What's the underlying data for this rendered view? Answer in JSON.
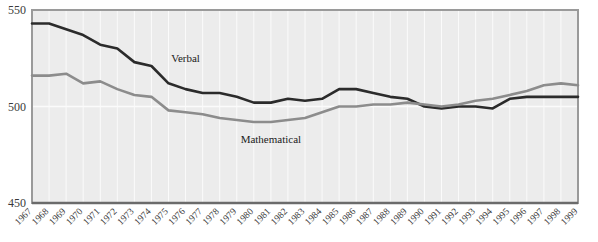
{
  "chart_data": {
    "type": "line",
    "title": "",
    "subtitle": "",
    "xlabel": "",
    "ylabel": "",
    "ylim": [
      450,
      550
    ],
    "yticks": [
      450,
      500,
      550
    ],
    "ytick_labels": [
      "450",
      "500",
      "550"
    ],
    "grid": true,
    "legend_position": "inline-annotation",
    "x": [
      1967,
      1968,
      1969,
      1970,
      1971,
      1972,
      1973,
      1974,
      1975,
      1976,
      1977,
      1978,
      1979,
      1980,
      1981,
      1982,
      1983,
      1984,
      1985,
      1986,
      1987,
      1988,
      1989,
      1990,
      1991,
      1992,
      1993,
      1994,
      1995,
      1996,
      1997,
      1998,
      1999
    ],
    "xtick_labels": [
      "1967",
      "1968",
      "1969",
      "1970",
      "1971",
      "1972",
      "1973",
      "1974",
      "1975",
      "1976",
      "1977",
      "1978",
      "1979",
      "1980",
      "1981",
      "1982",
      "1983",
      "1984",
      "1985",
      "1986",
      "1987",
      "1988",
      "1989",
      "1990",
      "1991",
      "1992",
      "1993",
      "1994",
      "1995",
      "1996",
      "1997",
      "1998",
      "1999"
    ],
    "series": [
      {
        "name": "Verbal",
        "color": "#2b2b2b",
        "label_annotation": "Verbal",
        "values": [
          543,
          543,
          540,
          537,
          532,
          530,
          523,
          521,
          512,
          509,
          507,
          507,
          505,
          502,
          502,
          504,
          503,
          504,
          509,
          509,
          507,
          505,
          504,
          500,
          499,
          500,
          500,
          499,
          504,
          505,
          505,
          505,
          505
        ]
      },
      {
        "name": "Mathematical",
        "color": "#8c8c8c",
        "label_annotation": "Mathematical",
        "values": [
          516,
          516,
          517,
          512,
          513,
          509,
          506,
          505,
          498,
          497,
          496,
          494,
          493,
          492,
          492,
          493,
          494,
          497,
          500,
          500,
          501,
          501,
          502,
          501,
          500,
          501,
          503,
          504,
          506,
          508,
          511,
          512,
          511
        ]
      }
    ]
  },
  "axes": {
    "y_title": "",
    "x_title": ""
  },
  "annotations": [
    {
      "text": "Verbal",
      "x_year": 1976,
      "y_value": 523
    },
    {
      "text": "Mathematical",
      "x_year": 1981,
      "y_value": 481
    }
  ]
}
